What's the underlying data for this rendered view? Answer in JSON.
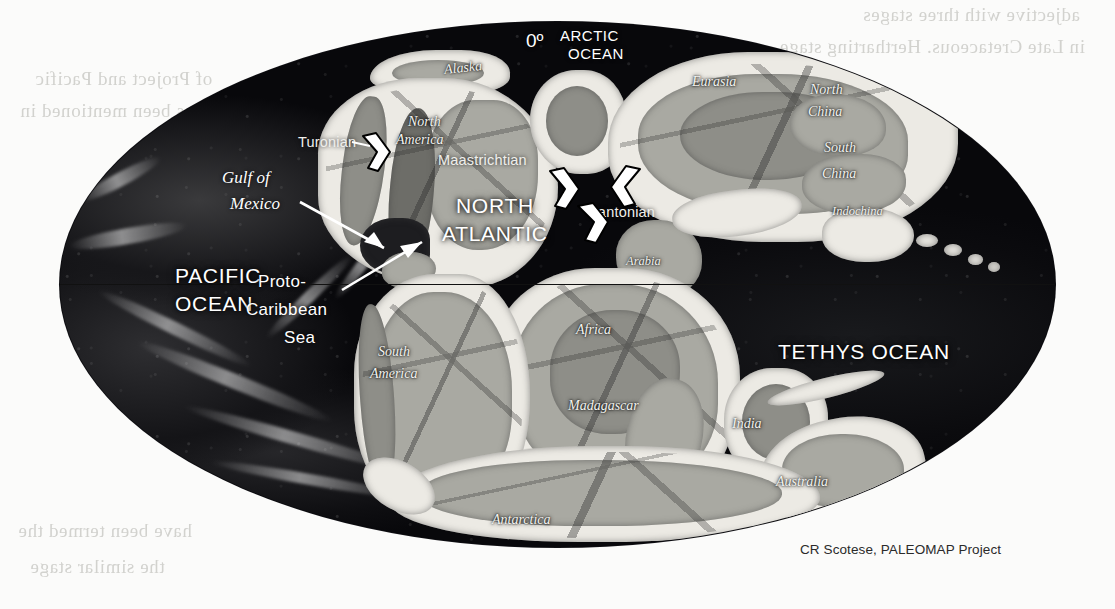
{
  "figure": {
    "type": "paleogeographic-map",
    "projection": "oval (Mollweide-style) global projection",
    "credit": "CR Scotese, PALEOMAP Project",
    "equator_label": "equator line"
  },
  "meridian": {
    "label": "0º"
  },
  "oceans": [
    {
      "id": "arctic",
      "label": "ARCTIC\nOCEAN",
      "line1": "ARCTIC",
      "line2": "OCEAN"
    },
    {
      "id": "pacific",
      "label": "PACIFIC\nOCEAN",
      "line1": "PACIFIC",
      "line2": "OCEAN"
    },
    {
      "id": "north-atlantic",
      "label": "NORTH\nATLANTIC",
      "line1": "NORTH",
      "line2": "ATLANTIC"
    },
    {
      "id": "tethys",
      "label": "TETHYS OCEAN",
      "line1": "TETHYS OCEAN"
    },
    {
      "id": "proto-caribbean",
      "label": "Proto-\nCaribbean\nSea",
      "line1": "Proto-",
      "line2": "Caribbean",
      "line3": "Sea"
    },
    {
      "id": "gulf-of-mexico",
      "label": "Gulf of\nMexico",
      "line1": "Gulf of",
      "line2": "Mexico"
    }
  ],
  "continents": [
    {
      "id": "alaska",
      "label": "Alaska"
    },
    {
      "id": "north-america",
      "label": "North\nAmerica",
      "line1": "North",
      "line2": "America"
    },
    {
      "id": "eurasia",
      "label": "Eurasia"
    },
    {
      "id": "north-china",
      "label": "North\nChina",
      "line1": "North",
      "line2": "China"
    },
    {
      "id": "south-china",
      "label": "South\nChina",
      "line1": "South",
      "line2": "China"
    },
    {
      "id": "indochina",
      "label": "Indochina"
    },
    {
      "id": "arabia",
      "label": "Arabia"
    },
    {
      "id": "africa",
      "label": "Africa"
    },
    {
      "id": "south-america",
      "label": "South\nAmerica",
      "line1": "South",
      "line2": "America"
    },
    {
      "id": "madagascar",
      "label": "Madagascar"
    },
    {
      "id": "india",
      "label": "India"
    },
    {
      "id": "australia",
      "label": "Australia"
    },
    {
      "id": "antarctica",
      "label": "Antarctica"
    }
  ],
  "stage_annotations": [
    {
      "id": "turonian",
      "label": "Turonian"
    },
    {
      "id": "maastrichtian",
      "label": "Maastrichtian"
    },
    {
      "id": "santonian",
      "label": "Santonian"
    }
  ],
  "colors": {
    "page_background": "#fbfbfa",
    "ocean_deep": "#08080b",
    "land_shelf": "#eceae4",
    "land_mid": "#a9a9a2",
    "land_high": "#8e8e88",
    "label_text": "#ffffff",
    "credit_text": "#2a2a2a",
    "equator_line": "#111111"
  },
  "scan_bleed_text": [
    "adjective  with  three  stages",
    "in  Late  Cretaceous.  Hertharting  stage",
    "of  Project  and  Pacific",
    "has  been  mentioned  in",
    "have  been  termed  the",
    "the  similar  stage"
  ]
}
